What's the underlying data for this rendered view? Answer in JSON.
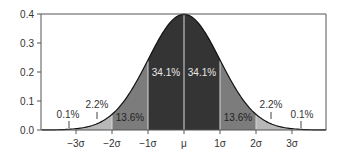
{
  "chart_data": {
    "type": "area",
    "title": "",
    "xlabel": "",
    "ylabel": "",
    "ylim": [
      0.0,
      0.4
    ],
    "yticks": [
      "0.0",
      "0.1",
      "0.2",
      "0.3",
      "0.4"
    ],
    "xticks": [
      "−3σ",
      "−2σ",
      "−1σ",
      "μ",
      "1σ",
      "2σ",
      "3σ"
    ],
    "grid": false,
    "legend": null,
    "curve": "standard normal distribution probability density",
    "peak_value": 0.399,
    "regions": [
      {
        "range": "below −3σ",
        "percent": "0.1%",
        "color": "#ffffff"
      },
      {
        "range": "−3σ to −2σ",
        "percent": "2.2%",
        "color": "#b3b3b3"
      },
      {
        "range": "−2σ to −1σ",
        "percent": "13.6%",
        "color": "#7a7a7a"
      },
      {
        "range": "−1σ to μ",
        "percent": "34.1%",
        "color": "#333333"
      },
      {
        "range": "μ to 1σ",
        "percent": "34.1%",
        "color": "#333333"
      },
      {
        "range": "1σ to 2σ",
        "percent": "13.6%",
        "color": "#7a7a7a"
      },
      {
        "range": "2σ to 3σ",
        "percent": "2.2%",
        "color": "#b3b3b3"
      },
      {
        "range": "above 3σ",
        "percent": "0.1%",
        "color": "#ffffff"
      }
    ],
    "annotations": [
      "0.1%",
      "2.2%",
      "13.6%",
      "34.1%",
      "34.1%",
      "13.6%",
      "2.2%",
      "0.1%"
    ]
  },
  "labels": {
    "y": [
      "0.0",
      "0.1",
      "0.2",
      "0.3",
      "0.4"
    ],
    "x": [
      "−3σ",
      "−2σ",
      "−1σ",
      "μ",
      "1σ",
      "2σ",
      "3σ"
    ],
    "pct_left_tail": "0.1%",
    "pct_left_22": "2.2%",
    "pct_left_136": "13.6%",
    "pct_left_341": "34.1%",
    "pct_right_341": "34.1%",
    "pct_right_136": "13.6%",
    "pct_right_22": "2.2%",
    "pct_right_tail": "0.1%"
  }
}
